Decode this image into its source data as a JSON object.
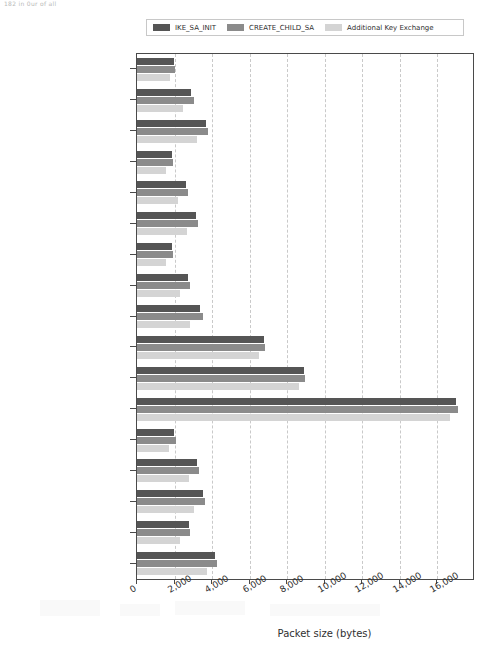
{
  "page_artifact": "182        in 0ur of all",
  "legend": {
    "position": "top-center",
    "items": [
      {
        "label": "IKE_SA_INIT",
        "color": "#555555",
        "icon": "legend-swatch"
      },
      {
        "label": "CREATE_CHILD_SA",
        "color": "#8b8b8b",
        "icon": "legend-swatch"
      },
      {
        "label": "Additional Key Exchange",
        "color": "#d4d4d4",
        "icon": "legend-swatch"
      }
    ]
  },
  "chart_data": {
    "type": "bar",
    "orientation": "horizontal",
    "title": "",
    "xlabel": "Packet size (bytes)",
    "ylabel": "",
    "xlim": [
      0,
      17900
    ],
    "xticks": [
      0,
      2000,
      4000,
      6000,
      8000,
      10000,
      12000,
      14000,
      16000
    ],
    "xticklabels": [
      "0",
      "2,000",
      "4,000",
      "6,000",
      "8,000",
      "10,000",
      "12,000",
      "14,000",
      "16,000"
    ],
    "grid": "x-only-dashed",
    "legend_position": "upper center (outside)",
    "categories": [
      "Kyber512",
      "Kyber768",
      "Kyber1024",
      "NTRU-HPS-2048509",
      "NTRU-HPS-2048607",
      "NTRU-HPS-4096821",
      "LightSaber",
      "Saber",
      "FireSaber",
      "RLizard-category1",
      "RLizard-category3",
      "RLizard-category5",
      "LAC-128",
      "LAC-196",
      "LAC-256",
      "AKCN-MLWE",
      "AKCN-SEC"
    ],
    "series": [
      {
        "name": "IKE_SA_INIT",
        "color": "#555555",
        "values": [
          1960,
          2860,
          3650,
          1850,
          2590,
          3120,
          1850,
          2700,
          3380,
          6770,
          8890,
          16990,
          1975,
          3200,
          3540,
          2760,
          4170
        ]
      },
      {
        "name": "CREATE_CHILD_SA",
        "color": "#8b8b8b",
        "values": [
          2010,
          3010,
          3760,
          1905,
          2700,
          3230,
          1905,
          2800,
          3490,
          6830,
          8940,
          17090,
          2070,
          3290,
          3640,
          2850,
          4260
        ]
      },
      {
        "name": "Additional Key Exchange",
        "color": "#d4d4d4",
        "values": [
          1745,
          2440,
          3175,
          1535,
          2170,
          2645,
          1570,
          2275,
          2800,
          6510,
          8625,
          16670,
          1680,
          2790,
          3020,
          2290,
          3730
        ]
      }
    ]
  }
}
